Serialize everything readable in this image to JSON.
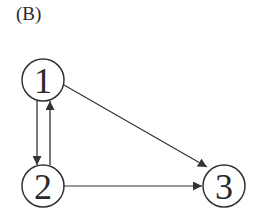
{
  "panel_label": "(B)",
  "colors": {
    "stroke": "#333333",
    "text": "#2a2a2a",
    "background": "#ffffff"
  },
  "nodes": [
    {
      "id": "1",
      "label": "1",
      "cx": 43,
      "cy": 80
    },
    {
      "id": "2",
      "label": "2",
      "cx": 43,
      "cy": 186
    },
    {
      "id": "3",
      "label": "3",
      "cx": 224,
      "cy": 186
    }
  ],
  "edges": [
    {
      "from": "1",
      "to": "2"
    },
    {
      "from": "2",
      "to": "1"
    },
    {
      "from": "1",
      "to": "3"
    },
    {
      "from": "2",
      "to": "3"
    }
  ]
}
